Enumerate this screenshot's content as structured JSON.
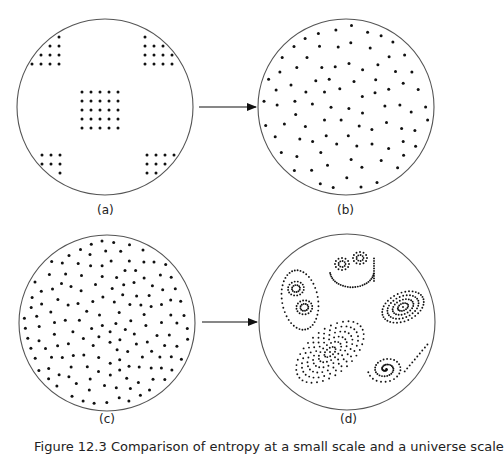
{
  "figure": {
    "caption": "Figure 12.3  Comparison of entropy at a small scale and a universe scale",
    "colors": {
      "circle": "#555555",
      "dot": "#111111",
      "arrow": "#111111",
      "background": "#ffffff"
    },
    "panels": [
      {
        "id": "a",
        "label": "(a)",
        "cx": 105,
        "cy": 107,
        "r": 88,
        "arrangement": "ordered-grid-clusters",
        "label_pos": [
          97,
          215
        ],
        "grids": [
          {
            "name": "center",
            "x0": 82,
            "y0": 92,
            "cols": 5,
            "rows": 5,
            "step": 9
          },
          {
            "name": "top-left",
            "x0": 32,
            "y0": 37,
            "cols": 4,
            "rows": 4,
            "step": 9
          },
          {
            "name": "top-right",
            "x0": 145,
            "y0": 37,
            "cols": 4,
            "rows": 4,
            "step": 9
          },
          {
            "name": "bottom-left",
            "x0": 33,
            "y0": 155,
            "cols": 4,
            "rows": 4,
            "step": 9
          },
          {
            "name": "bottom-right",
            "x0": 147,
            "y0": 155,
            "cols": 4,
            "rows": 4,
            "step": 9
          }
        ]
      },
      {
        "id": "b",
        "label": "(b)",
        "cx": 346,
        "cy": 107,
        "r": 88,
        "arrangement": "uniform-random",
        "label_pos": [
          337,
          215
        ],
        "dot_count": 115,
        "seed": 7
      },
      {
        "id": "c",
        "label": "(c)",
        "cx": 107,
        "cy": 323,
        "r": 88,
        "arrangement": "uniform-random",
        "label_pos": [
          99,
          424
        ],
        "dot_count": 190,
        "seed": 13
      },
      {
        "id": "d",
        "label": "(d)",
        "cx": 347,
        "cy": 322,
        "r": 88,
        "arrangement": "clustered-spirals",
        "label_pos": [
          340,
          424
        ],
        "clusters": [
          {
            "name": "left-double-loop",
            "cx": 300,
            "cy": 300,
            "rx": 18,
            "ry": 30,
            "rot": -10,
            "rings": 2,
            "type": "double"
          },
          {
            "name": "top-cup",
            "cx": 352,
            "cy": 268,
            "rx": 22,
            "ry": 16,
            "rot": 0,
            "rings": 1,
            "type": "cup"
          },
          {
            "name": "right-spiral",
            "cx": 403,
            "cy": 307,
            "rx": 22,
            "ry": 14,
            "rot": -25,
            "rings": 4,
            "type": "ellipse"
          },
          {
            "name": "big-galaxy",
            "cx": 330,
            "cy": 352,
            "rx": 40,
            "ry": 22,
            "rot": -40,
            "rings": 6,
            "type": "ellipse"
          },
          {
            "name": "bottom-right-spiral",
            "cx": 386,
            "cy": 369,
            "rx": 18,
            "ry": 14,
            "rot": -10,
            "rings": 3,
            "type": "spiral"
          }
        ]
      }
    ],
    "arrows": [
      {
        "name": "arrow-a-to-b",
        "x1": 199,
        "y1": 107,
        "x2": 256,
        "y2": 107
      },
      {
        "name": "arrow-c-to-d",
        "x1": 202,
        "y1": 322,
        "x2": 257,
        "y2": 322
      }
    ]
  }
}
